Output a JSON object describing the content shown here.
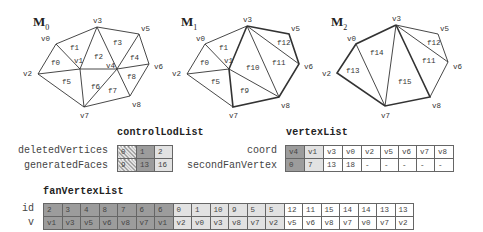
{
  "meshes": [
    {
      "title": "M",
      "subscript": "0",
      "vertices": {
        "v0": [
          56,
          44
        ],
        "v1": [
          80,
          69
        ],
        "v2": [
          38,
          74
        ],
        "v3": [
          97,
          27
        ],
        "v4": [
          117,
          69
        ],
        "v5": [
          139,
          34
        ],
        "v6": [
          149,
          64
        ],
        "v7": [
          84,
          107
        ],
        "v8": [
          130,
          96
        ]
      },
      "faces": [
        "f0",
        "f1",
        "f2",
        "f3",
        "f4",
        "f5",
        "f6",
        "f7",
        "f8"
      ]
    },
    {
      "title": "M",
      "subscript": "1",
      "vertices": {
        "v0": [
          205,
          44
        ],
        "v1": [
          229,
          69
        ],
        "v2": [
          187,
          74
        ],
        "v3": [
          247,
          26
        ],
        "v5": [
          289,
          34
        ],
        "v6": [
          299,
          64
        ],
        "v7": [
          233,
          107
        ],
        "v8": [
          279,
          97
        ]
      },
      "faces": [
        "f0",
        "f1",
        "f5",
        "f9",
        "f10",
        "f11",
        "f12"
      ]
    },
    {
      "title": "M",
      "subscript": "2",
      "vertices": {
        "v0": [
          356,
          44
        ],
        "v2": [
          337,
          73
        ],
        "v3": [
          396,
          25
        ],
        "v5": [
          438,
          34
        ],
        "v6": [
          448,
          62
        ],
        "v7": [
          385,
          106
        ],
        "v8": [
          430,
          97
        ]
      },
      "faces": [
        "f11",
        "f12",
        "f13",
        "f14",
        "f15"
      ]
    }
  ],
  "controlLodList": {
    "title": "controlLodList",
    "rows": [
      {
        "label": "deletedVertices",
        "cells": [
          "0",
          "1",
          "2"
        ]
      },
      {
        "label": "generatedFaces",
        "cells": [
          "9",
          "13",
          "16"
        ]
      }
    ]
  },
  "vertexList": {
    "title": "vertexList",
    "rows": [
      {
        "label": "coord",
        "cells": [
          "v4",
          "v1",
          "v3",
          "v0",
          "v2",
          "v5",
          "v6",
          "v7",
          "v8"
        ]
      },
      {
        "label": "secondFanVertex",
        "cells": [
          "0",
          "7",
          "13",
          "18",
          "-",
          "-",
          "-",
          "-",
          "-"
        ]
      }
    ]
  },
  "fanVertexList": {
    "title": "fanVertexList",
    "rows": [
      {
        "label": "id",
        "cells": [
          "2",
          "3",
          "4",
          "8",
          "7",
          "6",
          "6",
          "0",
          "1",
          "10",
          "9",
          "5",
          "5",
          "12",
          "11",
          "15",
          "14",
          "14",
          "13",
          "13"
        ]
      },
      {
        "label": "v",
        "cells": [
          "v1",
          "v3",
          "v5",
          "v6",
          "v8",
          "v7",
          "v1",
          "v2",
          "v0",
          "v3",
          "v8",
          "v7",
          "v2",
          "v5",
          "v6",
          "v8",
          "v7",
          "v0",
          "v7",
          "v2"
        ]
      }
    ]
  },
  "colors": {
    "dark": "#9c9c9c",
    "mid": "#c4c4c4",
    "light": "#e2e2e2",
    "white": "#ffffff",
    "line": "#333333"
  }
}
